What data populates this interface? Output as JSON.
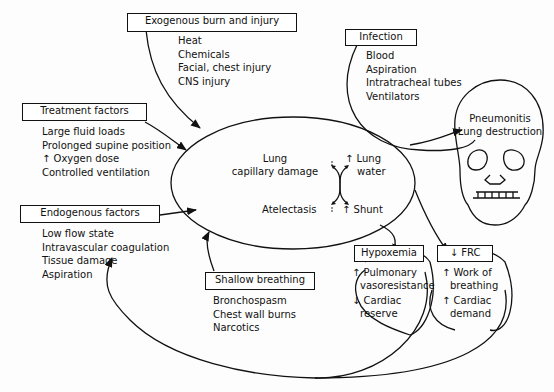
{
  "exogenous": {
    "title": "Exogenous burn and injury",
    "items": [
      "Heat",
      "Chemicals",
      "Facial, chest injury",
      "CNS injury"
    ]
  },
  "infection": {
    "title": "Infection",
    "items": [
      "Blood",
      "Aspiration",
      "Intratracheal tubes",
      "Ventilators"
    ]
  },
  "treatment": {
    "title": "Treatment factors",
    "items": [
      "Large fluid loads",
      "Prolonged supine position",
      "↑ Oxygen dose",
      "Controlled ventilation"
    ]
  },
  "endogenous": {
    "title": "Endogenous factors",
    "items": [
      "Low flow state",
      "Intravascular coagulation",
      "Tissue damage",
      "Aspiration"
    ]
  },
  "shallow": {
    "title": "Shallow breathing",
    "items": [
      "Bronchospasm",
      "Chest wall burns",
      "Narcotics"
    ]
  },
  "center": {
    "lung_cap_1": "Lung",
    "lung_cap_2": "capillary damage",
    "lung_water_1": "↑ Lung",
    "lung_water_2": "water",
    "atelectasis": "Atelectasis",
    "shunt": "↑ Shunt"
  },
  "skull": {
    "line1": "Pneumonitis",
    "line2": "Lung destruction"
  },
  "hypoxemia": {
    "title": "Hypoxemia",
    "items": [
      "↑ Pulmonary",
      "vasoresistance",
      "↓ Cardiac",
      "reserve"
    ]
  },
  "frc": {
    "title": "↓ FRC",
    "items": [
      "↑ Work of",
      "breathing",
      "↑ Cardiac",
      "demand"
    ]
  }
}
